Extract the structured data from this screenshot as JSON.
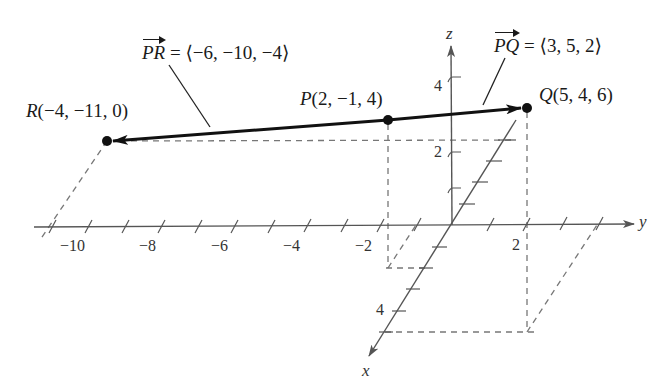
{
  "figure": {
    "type": "3d-coordinate-diagram",
    "axes": {
      "x": {
        "name": "x",
        "ticks": [
          {
            "value": 4,
            "label": "4"
          }
        ]
      },
      "y": {
        "name": "y",
        "ticks": [
          {
            "value": -10,
            "label": "−10"
          },
          {
            "value": -8,
            "label": "−8"
          },
          {
            "value": -6,
            "label": "−6"
          },
          {
            "value": -4,
            "label": "−4"
          },
          {
            "value": -2,
            "label": "−2"
          },
          {
            "value": 2,
            "label": "2"
          }
        ]
      },
      "z": {
        "name": "z",
        "ticks": [
          {
            "value": 2,
            "label": "2"
          },
          {
            "value": 4,
            "label": "4"
          }
        ]
      }
    },
    "points": {
      "P": {
        "name": "P",
        "coords": "(2, −1, 4)"
      },
      "Q": {
        "name": "Q",
        "coords": "(5, 4, 6)"
      },
      "R": {
        "name": "R",
        "coords": "(−4, −11, 0)"
      }
    },
    "vectors": {
      "PQ": {
        "name": "PQ",
        "value": "= ⟨3, 5, 2⟩"
      },
      "PR": {
        "name": "PR",
        "value": "= ⟨−6, −10, −4⟩"
      }
    },
    "colors": {
      "axis": "#555555",
      "vector": "#111111",
      "dashed": "#777777",
      "point": "#111111"
    }
  }
}
